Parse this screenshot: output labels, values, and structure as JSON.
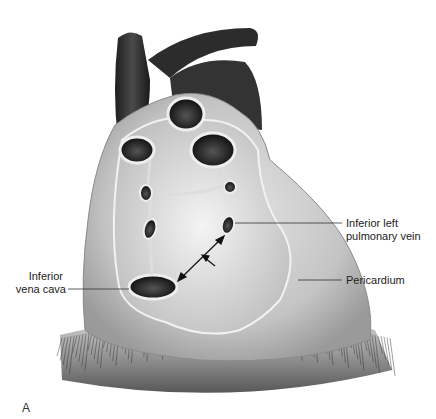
{
  "figure": {
    "panel_label": "A",
    "labels": {
      "inferior_left_pulmonary_vein": [
        "Inferior left",
        "pulmonary vein"
      ],
      "inferior_vena_cava": [
        "Inferior",
        "vena cava"
      ],
      "pericardium": [
        "Pericardium"
      ]
    }
  }
}
